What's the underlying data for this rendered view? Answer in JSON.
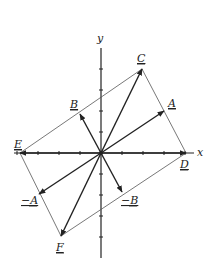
{
  "diagram": {
    "type": "vector-diagram",
    "axes": {
      "x_label": "x",
      "y_label": "y",
      "origin_px": [
        101,
        153
      ],
      "tick_spacing_px": 21,
      "x_ticks": [
        -4,
        -3,
        -2,
        -1,
        1,
        2,
        3,
        4
      ],
      "y_ticks": [
        -4,
        -3,
        -2,
        -1,
        1,
        2,
        3,
        4
      ]
    },
    "vectors": [
      {
        "name": "A",
        "label": "A",
        "tip_px": [
          164,
          111
        ],
        "label_px": [
          168,
          107
        ],
        "style": "bold"
      },
      {
        "name": "B",
        "label": "B",
        "tip_px": [
          80,
          114
        ],
        "label_px": [
          70,
          108
        ],
        "style": "bold"
      },
      {
        "name": "C",
        "label": "C",
        "tip_px": [
          142,
          69
        ],
        "label_px": [
          137,
          62
        ],
        "style": "bold"
      },
      {
        "name": "D",
        "label": "D",
        "tip_px": [
          186,
          153
        ],
        "label_px": [
          180,
          168
        ],
        "style": "bold"
      },
      {
        "name": "E",
        "label": "E",
        "tip_px": [
          20,
          153
        ],
        "label_px": [
          14,
          148
        ],
        "style": "bold"
      },
      {
        "name": "F",
        "label": "F",
        "tip_px": [
          61,
          236
        ],
        "label_px": [
          56,
          251
        ],
        "style": "bold"
      },
      {
        "name": "neg-A",
        "label": "−A",
        "tip_px": [
          39,
          194
        ],
        "label_px": [
          21,
          204
        ],
        "style": "bold"
      },
      {
        "name": "neg-B",
        "label": "−B",
        "tip_px": [
          122,
          192
        ],
        "label_px": [
          121,
          204
        ],
        "style": "bold"
      }
    ],
    "parallelogram_lines": [
      {
        "from": "E",
        "to": "C"
      },
      {
        "from": "C",
        "to": "D"
      },
      {
        "from": "D",
        "to": "F"
      },
      {
        "from": "F",
        "to": "E"
      }
    ],
    "colors": {
      "line": "#222222",
      "thin_line": "#555555",
      "background": "#ffffff"
    }
  }
}
